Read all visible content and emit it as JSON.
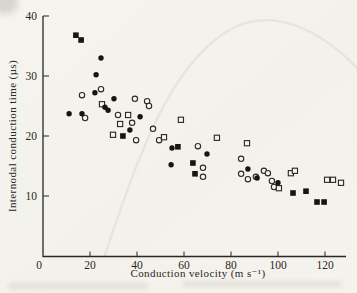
{
  "figure": {
    "background_color": "#f5f3ee",
    "ink_color": "#2b2723"
  },
  "chart_data": {
    "type": "scatter",
    "title": "",
    "xlabel": "Conduction velocity (m s⁻¹)",
    "ylabel": "Internodal conduction time (µs)",
    "xlim": [
      0,
      129
    ],
    "ylim": [
      0,
      40
    ],
    "x_ticks": [
      0,
      20,
      40,
      60,
      80,
      100,
      120
    ],
    "y_ticks": [
      10,
      20,
      30,
      40
    ],
    "origin_label": "0",
    "grid": false,
    "legend_position": "none",
    "marker_colors": {
      "filled": "#181410",
      "open_fill": "#f5f3ee",
      "open_stroke": "#2b2723"
    },
    "series": [
      {
        "name": "filled squares",
        "marker": "square",
        "fill": "filled",
        "points": [
          [
            14.0,
            36.8
          ],
          [
            16.2,
            36.0
          ],
          [
            34.0,
            20.0
          ],
          [
            57.4,
            18.2
          ],
          [
            63.8,
            15.5
          ],
          [
            64.7,
            13.7
          ],
          [
            106.4,
            10.5
          ],
          [
            111.9,
            10.8
          ],
          [
            116.6,
            9.0
          ],
          [
            119.6,
            9.0
          ]
        ]
      },
      {
        "name": "filled circles",
        "marker": "circle",
        "fill": "filled",
        "points": [
          [
            24.7,
            33.0
          ],
          [
            22.6,
            30.2
          ],
          [
            22.1,
            27.2
          ],
          [
            30.2,
            26.2
          ],
          [
            26.4,
            24.8
          ],
          [
            27.7,
            24.3
          ],
          [
            11.1,
            23.7
          ],
          [
            16.6,
            23.7
          ],
          [
            41.3,
            23.2
          ],
          [
            37.0,
            21.0
          ],
          [
            54.9,
            18.0
          ],
          [
            69.8,
            17.0
          ],
          [
            54.5,
            15.2
          ],
          [
            87.2,
            14.5
          ],
          [
            91.1,
            13.0
          ],
          [
            100.0,
            12.2
          ]
        ]
      },
      {
        "name": "open circles",
        "marker": "circle",
        "fill": "open",
        "points": [
          [
            16.6,
            26.8
          ],
          [
            24.7,
            27.8
          ],
          [
            39.1,
            26.2
          ],
          [
            44.3,
            25.8
          ],
          [
            45.1,
            25.0
          ],
          [
            17.9,
            23.0
          ],
          [
            31.9,
            23.5
          ],
          [
            37.9,
            22.2
          ],
          [
            39.6,
            19.3
          ],
          [
            46.8,
            21.2
          ],
          [
            49.4,
            19.3
          ],
          [
            65.9,
            18.3
          ],
          [
            68.1,
            14.7
          ],
          [
            68.1,
            13.2
          ],
          [
            84.3,
            16.2
          ],
          [
            84.3,
            13.7
          ],
          [
            87.2,
            12.8
          ],
          [
            90.6,
            13.2
          ],
          [
            94.0,
            14.2
          ],
          [
            95.7,
            13.8
          ],
          [
            97.4,
            12.5
          ],
          [
            98.3,
            11.5
          ]
        ]
      },
      {
        "name": "open squares",
        "marker": "square",
        "fill": "open",
        "points": [
          [
            25.1,
            25.3
          ],
          [
            36.2,
            23.5
          ],
          [
            32.8,
            22.0
          ],
          [
            29.8,
            20.2
          ],
          [
            51.5,
            19.8
          ],
          [
            58.7,
            22.7
          ],
          [
            74.0,
            19.7
          ],
          [
            86.8,
            18.8
          ],
          [
            100.4,
            11.3
          ],
          [
            105.5,
            13.8
          ],
          [
            107.2,
            14.2
          ],
          [
            120.9,
            12.7
          ],
          [
            123.4,
            12.7
          ],
          [
            126.8,
            12.2
          ]
        ]
      }
    ]
  }
}
